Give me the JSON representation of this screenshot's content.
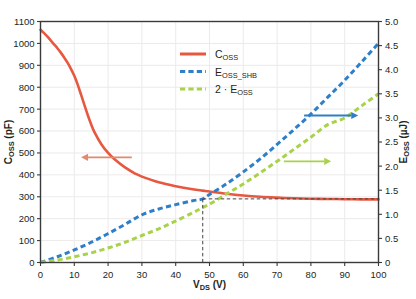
{
  "chart_data": {
    "type": "line",
    "title": "",
    "xlabel": "VDS (V)",
    "xlabel_main": "V",
    "xlabel_sub": "DS",
    "xlabel_unit": " (V)",
    "ylabel_left": "Coss (pF)",
    "ylabel_left_main": "C",
    "ylabel_left_sub": "OSS",
    "ylabel_left_unit": " (pF)",
    "ylabel_right": "Eoss (µJ)",
    "ylabel_right_main": "E",
    "ylabel_right_sub": "OSS",
    "ylabel_right_unit": " (µJ)",
    "xlim": [
      0,
      100
    ],
    "ylim_left": [
      0,
      1100
    ],
    "ylim_right": [
      0,
      5.0
    ],
    "xticks": [
      0,
      10,
      20,
      30,
      40,
      50,
      60,
      70,
      80,
      90,
      100
    ],
    "xtick_labels": [
      "0",
      "10",
      "20",
      "30",
      "40",
      "50",
      "60",
      "70",
      "80",
      "90",
      "100"
    ],
    "yticks_left": [
      0,
      100,
      200,
      300,
      400,
      500,
      600,
      700,
      800,
      900,
      1000,
      1100
    ],
    "ytick_labels_left": [
      "0",
      "100",
      "200",
      "300",
      "400",
      "500",
      "600",
      "700",
      "800",
      "900",
      "1000",
      "1100"
    ],
    "yticks_right": [
      0,
      0.5,
      1.0,
      1.5,
      2.0,
      2.5,
      3.0,
      3.5,
      4.0,
      4.5,
      5.0
    ],
    "ytick_labels_right": [
      "0",
      "0.5",
      "1.0",
      "1.5",
      "2.0",
      "2.5",
      "3.0",
      "3.5",
      "4.0",
      "4.5",
      "5.0"
    ],
    "grid": true,
    "legend_position": "upper-center",
    "series": [
      {
        "name": "Coss",
        "label_main": "C",
        "label_sub": "OSS",
        "label_sub2": "",
        "color": "#e8573f",
        "style": "solid",
        "axis": "left",
        "x": [
          0,
          1,
          2,
          3,
          4,
          5,
          6,
          7,
          8,
          9,
          10,
          11,
          12,
          13,
          14,
          15,
          16,
          18,
          20,
          22,
          25,
          28,
          30,
          35,
          40,
          45,
          48,
          50,
          55,
          60,
          65,
          70,
          75,
          80,
          85,
          90,
          95,
          100
        ],
        "values": [
          1062,
          1048,
          1032,
          1014,
          996,
          978,
          958,
          936,
          912,
          884,
          852,
          812,
          766,
          718,
          672,
          630,
          594,
          540,
          500,
          470,
          434,
          406,
          392,
          366,
          348,
          334,
          328,
          324,
          314,
          306,
          300,
          296,
          293,
          291,
          290,
          289,
          288,
          288
        ]
      },
      {
        "name": "Eoss_shb",
        "label_main": "E",
        "label_sub": "OSS",
        "label_sub2": "_SHB",
        "color": "#2e7ec8",
        "style": "dashed",
        "axis": "right",
        "x": [
          0,
          5,
          10,
          15,
          20,
          25,
          30,
          35,
          40,
          45,
          48,
          50,
          55,
          60,
          65,
          70,
          75,
          80,
          85,
          90,
          95,
          100
        ],
        "values": [
          0.0,
          0.12,
          0.26,
          0.42,
          0.6,
          0.79,
          0.99,
          1.11,
          1.2,
          1.28,
          1.32,
          1.41,
          1.63,
          1.88,
          2.15,
          2.45,
          2.76,
          3.08,
          3.43,
          3.78,
          4.16,
          4.55
        ]
      },
      {
        "name": "2 · Eoss",
        "label_main": "2 · E",
        "label_sub": "OSS",
        "label_sub2": "",
        "color": "#a8d24a",
        "style": "dashed",
        "axis": "right",
        "x": [
          0,
          5,
          10,
          15,
          20,
          25,
          30,
          35,
          40,
          45,
          48,
          50,
          55,
          60,
          65,
          70,
          75,
          80,
          85,
          90,
          95,
          100
        ],
        "values": [
          0.0,
          0.05,
          0.12,
          0.2,
          0.3,
          0.42,
          0.56,
          0.7,
          0.86,
          1.03,
          1.14,
          1.21,
          1.42,
          1.63,
          1.86,
          2.1,
          2.35,
          2.6,
          2.86,
          3.0,
          3.25,
          3.5
        ]
      }
    ],
    "annotations": {
      "left_arrow": {
        "name": "coss-left-arrow",
        "color": "#e08a6e",
        "x_from": 27,
        "x_to": 12,
        "y_left": 480
      },
      "right_arrow_blue": {
        "name": "eoss-shb-right-arrow",
        "color": "#2e7ec8",
        "x_from": 78,
        "x_to": 94,
        "y_right": 3.05
      },
      "right_arrow_green": {
        "name": "two-eoss-right-arrow",
        "color": "#a8d24a",
        "x_from": 72,
        "x_to": 86,
        "y_right": 2.1
      },
      "vline_x": 48,
      "hline_y_right": 1.32,
      "dash_color": "#444444"
    }
  }
}
